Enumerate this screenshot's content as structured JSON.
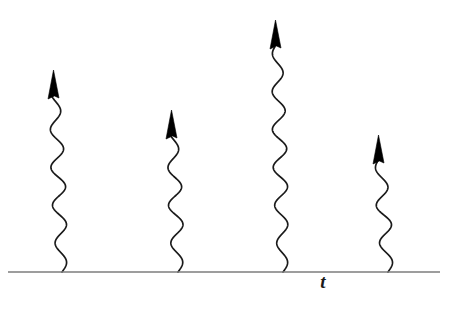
{
  "figure": {
    "width": 460,
    "height": 309,
    "background_color": "#ffffff"
  },
  "axis": {
    "name": "time-axis",
    "label": "t",
    "label_x": 323,
    "label_y": 288,
    "baseline_y": 272,
    "x_start": 8,
    "x_end": 440,
    "color": "#7d7d7d",
    "stroke_width": 1.6
  },
  "wave_style": {
    "color": "#1a1a1a",
    "stroke_width": 1.7,
    "amplitude": 7,
    "period": 38,
    "arrowhead_color": "#000000",
    "arrowhead_width": 13,
    "arrowhead_height": 29
  },
  "chart_data": {
    "type": "line",
    "xlabel": "t",
    "ylabel": "",
    "grid": false,
    "legend": "none",
    "categories": [
      "arrow-1",
      "arrow-2",
      "arrow-3",
      "arrow-4"
    ],
    "values": [
      202,
      162,
      252,
      137
    ],
    "arrows": [
      {
        "name": "arrow-1",
        "x": 62,
        "base_y": 272,
        "tip_y": 70,
        "height": 202,
        "amplitude": 7,
        "period": 38,
        "tilt": -7
      },
      {
        "name": "arrow-2",
        "x": 178,
        "base_y": 272,
        "tip_y": 110,
        "height": 162,
        "amplitude": 7,
        "period": 38,
        "tilt": -5
      },
      {
        "name": "arrow-3",
        "x": 283,
        "base_y": 272,
        "tip_y": 20,
        "height": 252,
        "amplitude": 7,
        "period": 38,
        "tilt": -6
      },
      {
        "name": "arrow-4",
        "x": 388,
        "base_y": 272,
        "tip_y": 135,
        "height": 137,
        "amplitude": 7,
        "period": 38,
        "tilt": -8
      }
    ]
  }
}
